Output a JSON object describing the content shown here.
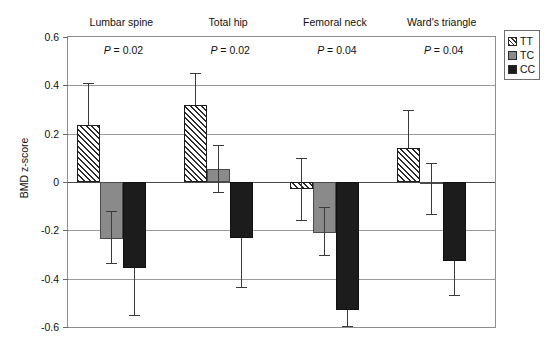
{
  "chart_data": {
    "type": "bar",
    "title": "",
    "xlabel": "",
    "ylabel": "BMD z-score",
    "ylim": [
      -0.6,
      0.6
    ],
    "yticks": [
      0.6,
      0.4,
      0.2,
      0,
      -0.2,
      -0.4,
      -0.6
    ],
    "ytick_labels": [
      "0.6",
      "0.4",
      "0.2",
      "0",
      "-0.2",
      "-0.4",
      "-0.6"
    ],
    "grid": true,
    "legend_position": "outside-top-right",
    "categories": [
      "Lumbar spine",
      "Total hip",
      "Femoral neck",
      "Ward's triangle"
    ],
    "annotations": [
      {
        "text": "P = 0.02",
        "category": "Lumbar spine"
      },
      {
        "text": "P = 0.02",
        "category": "Total hip"
      },
      {
        "text": "P = 0.04",
        "category": "Femoral neck"
      },
      {
        "text": "P = 0.04",
        "category": "Ward's triangle"
      }
    ],
    "series": [
      {
        "name": "TT",
        "fill": "hatched",
        "color": "#ffffff",
        "values": [
          0.235,
          0.32,
          -0.03,
          0.14
        ],
        "err_high": [
          0.41,
          0.45,
          0.1,
          0.3
        ],
        "err_low": [
          0.235,
          0.32,
          -0.16,
          0.14
        ]
      },
      {
        "name": "TC",
        "fill": "solid-gray",
        "color": "#8a8a8a",
        "values": [
          -0.235,
          0.055,
          -0.21,
          -0.01
        ],
        "err_high": [
          -0.12,
          0.155,
          -0.105,
          0.08
        ],
        "err_low": [
          -0.34,
          -0.045,
          -0.305,
          -0.135
        ]
      },
      {
        "name": "CC",
        "fill": "solid-black",
        "color": "#1c1c1c",
        "values": [
          -0.355,
          -0.23,
          -0.53,
          -0.325
        ],
        "err_high": [
          -0.355,
          -0.23,
          -0.53,
          -0.325
        ],
        "err_low": [
          -0.555,
          -0.44,
          -0.6,
          -0.47
        ]
      }
    ]
  },
  "legend": {
    "items": [
      {
        "label": "TT",
        "swatch": "hatched-swatch-icon"
      },
      {
        "label": "TC",
        "swatch": "gray-swatch-icon"
      },
      {
        "label": "CC",
        "swatch": "black-swatch-icon"
      }
    ]
  }
}
